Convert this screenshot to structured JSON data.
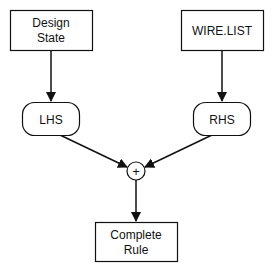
{
  "diagram": {
    "nodes": {
      "design_state": {
        "line1": "Design",
        "line2": "State",
        "shape": "rectangle"
      },
      "wire_list": {
        "label": "WIRE.LIST",
        "shape": "rectangle"
      },
      "lhs": {
        "label": "LHS",
        "shape": "rounded-rectangle"
      },
      "rhs": {
        "label": "RHS",
        "shape": "rounded-rectangle"
      },
      "combine": {
        "label": "+",
        "shape": "circle"
      },
      "complete_rule": {
        "line1": "Complete",
        "line2": "Rule",
        "shape": "rectangle"
      }
    },
    "edges": [
      {
        "from": "design_state",
        "to": "lhs"
      },
      {
        "from": "wire_list",
        "to": "rhs"
      },
      {
        "from": "lhs",
        "to": "combine"
      },
      {
        "from": "rhs",
        "to": "combine"
      },
      {
        "from": "combine",
        "to": "complete_rule"
      }
    ],
    "colors": {
      "stroke": "#111111",
      "fill": "#ffffff",
      "text": "#111111"
    }
  }
}
